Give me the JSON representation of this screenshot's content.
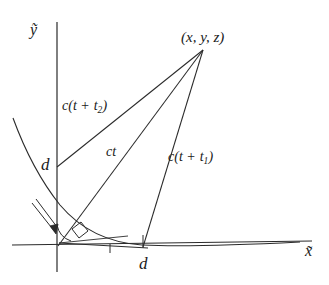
{
  "figure": {
    "type": "geometry-diagram",
    "background_color": "#ffffff",
    "stroke_color": "#2b2b2b",
    "axes": {
      "y_axis_label": "ỹ",
      "x_axis_label": "x̃"
    },
    "labels": {
      "source_point": "(x, y, z)",
      "distance_y_axis": "d",
      "distance_x_axis": "d",
      "ray_upper": {
        "prefix": "c(t +",
        "subscript_var": "t",
        "subscript_index": "2",
        "suffix": ")",
        "full": "c(t + t2)"
      },
      "ray_middle": "ct",
      "ray_lower": {
        "prefix": "c(t +",
        "subscript_var": "t",
        "subscript_index": "1",
        "suffix": ")",
        "full": "c(t + t1)"
      }
    },
    "markers": {
      "right_angle": "right-angle-square",
      "origin_angle": "angle-arc",
      "incidence_arrow": "down-right-arrow"
    }
  }
}
